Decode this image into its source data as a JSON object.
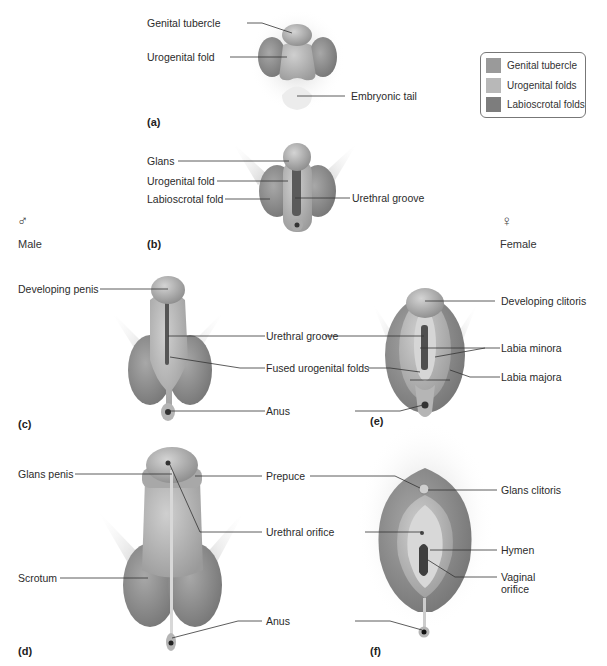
{
  "legend": {
    "items": [
      {
        "label": "Genital tubercle",
        "color": "#9a9a9a"
      },
      {
        "label": "Urogenital folds",
        "color": "#b8b8b8"
      },
      {
        "label": "Labioscrotal folds",
        "color": "#7d7d7d"
      }
    ]
  },
  "sexes": {
    "male": {
      "symbol": "♂",
      "label": "Male"
    },
    "female": {
      "symbol": "♀",
      "label": "Female"
    }
  },
  "panels": {
    "a": {
      "tag": "(a)",
      "labels": {
        "genital_tubercle": "Genital tubercle",
        "urogenital_fold": "Urogenital fold",
        "embryonic_tail": "Embryonic tail"
      }
    },
    "b": {
      "tag": "(b)",
      "labels": {
        "glans": "Glans",
        "urogenital_fold": "Urogenital fold",
        "labioscrotal_fold": "Labioscrotal fold",
        "urethral_groove": "Urethral groove"
      }
    },
    "c": {
      "tag": "(c)",
      "labels": {
        "developing_penis": "Developing penis"
      }
    },
    "ce_shared": {
      "labels": {
        "urethral_groove": "Urethral groove",
        "fused_urogenital_folds": "Fused urogenital folds",
        "anus": "Anus"
      }
    },
    "e": {
      "tag": "(e)",
      "labels": {
        "developing_clitoris": "Developing clitoris",
        "labia_minora": "Labia minora",
        "labia_majora": "Labia majora"
      }
    },
    "d": {
      "tag": "(d)",
      "labels": {
        "glans_penis": "Glans penis",
        "scrotum": "Scrotum"
      }
    },
    "df_shared": {
      "labels": {
        "prepuce": "Prepuce",
        "urethral_orifice": "Urethral orifice",
        "anus": "Anus"
      }
    },
    "f": {
      "tag": "(f)",
      "labels": {
        "glans_clitoris": "Glans clitoris",
        "hymen": "Hymen",
        "vaginal_orifice_1": "Vaginal",
        "vaginal_orifice_2": "orifice"
      }
    }
  }
}
